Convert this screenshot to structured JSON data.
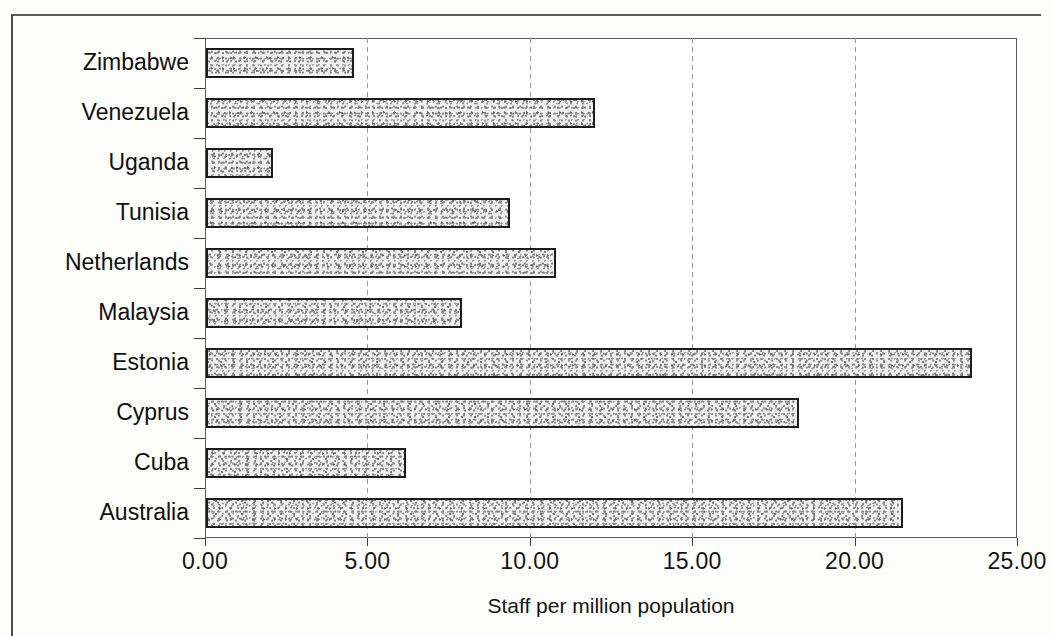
{
  "chart_data": {
    "type": "bar",
    "orientation": "horizontal",
    "title": "",
    "xlabel": "Staff per million population",
    "ylabel": "",
    "categories": [
      "Zimbabwe",
      "Venezuela",
      "Uganda",
      "Tunisia",
      "Netherlands",
      "Malaysia",
      "Estonia",
      "Cyprus",
      "Cuba",
      "Australia"
    ],
    "values": [
      4.6,
      12.0,
      2.1,
      9.4,
      10.8,
      7.9,
      23.6,
      18.3,
      6.2,
      21.5
    ],
    "series": [
      {
        "name": "Staff per million population",
        "values": [
          4.6,
          12.0,
          2.1,
          9.4,
          10.8,
          7.9,
          23.6,
          18.3,
          6.2,
          21.5
        ]
      }
    ],
    "xlim": [
      0,
      25
    ],
    "xticks": [
      0,
      5,
      10,
      15,
      20,
      25
    ],
    "xtick_labels": [
      "0.00",
      "5.00",
      "10.00",
      "15.00",
      "20.00",
      "25.00"
    ],
    "grid": "vertical-dashed",
    "legend": "none",
    "bar_fill": "#efefef",
    "bar_edge": "#1b1b1b",
    "axis_color": "#3c3c3c"
  }
}
